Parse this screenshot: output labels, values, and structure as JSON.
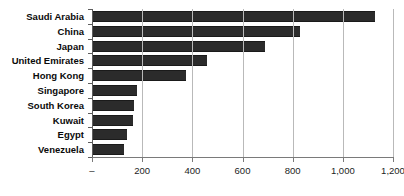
{
  "chart_data": {
    "type": "bar",
    "orientation": "horizontal",
    "title": "",
    "xlabel": "",
    "ylabel": "",
    "categories": [
      "Saudi Arabia",
      "China",
      "Japan",
      "United Emirates",
      "Hong Kong",
      "Singapore",
      "South Korea",
      "Kuwait",
      "Egypt",
      "Venezuela"
    ],
    "values": [
      1130,
      830,
      690,
      460,
      375,
      180,
      168,
      163,
      140,
      128
    ],
    "xlim": [
      0,
      1200
    ],
    "xticks": [
      0,
      200,
      400,
      600,
      800,
      1000,
      1200
    ],
    "xtick_labels": [
      "–",
      "200",
      "400",
      "600",
      "800",
      "1,000",
      "1,200"
    ],
    "grid": true,
    "grid_axis": "x",
    "legend": false,
    "bar_color": "#2b2b2b",
    "gridline_color": "#b9b9b9",
    "axis_color": "#7a7a7a"
  }
}
